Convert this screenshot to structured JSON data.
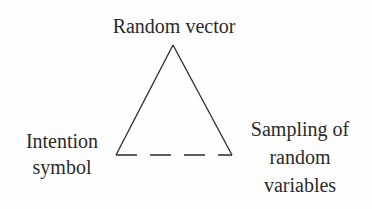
{
  "diagram": {
    "type": "triangle",
    "nodes": {
      "top": {
        "label": "Random vector"
      },
      "left": {
        "lines": [
          "Intention",
          "symbol"
        ]
      },
      "right": {
        "lines": [
          "Sampling of",
          "random",
          "variables"
        ]
      }
    },
    "edges": [
      {
        "from": "top",
        "to": "left",
        "style": "solid"
      },
      {
        "from": "top",
        "to": "right",
        "style": "solid"
      },
      {
        "from": "left",
        "to": "right",
        "style": "dashed"
      }
    ],
    "colors": {
      "line": "#2a2a2a",
      "background": "#fefefe"
    }
  }
}
